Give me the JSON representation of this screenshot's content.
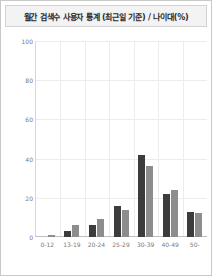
{
  "widget": {
    "title": "월간 검색수 사용자 통계 (최근일 기준) / 나이대(%)"
  },
  "chart_data": {
    "type": "bar",
    "title": "월간 검색수 사용자 통계 (최근일 기준) / 나이대(%)",
    "xlabel": "",
    "ylabel": "",
    "ylim": [
      0,
      100
    ],
    "yticks": [
      100,
      80,
      60,
      40,
      20,
      0
    ],
    "grid": true,
    "legend": "none",
    "categories": [
      "0-12",
      "13-19",
      "20-24",
      "25-29",
      "30-39",
      "40-49",
      "50-"
    ],
    "series": [
      {
        "name": "series-1",
        "color": "#3c3c3c",
        "values": [
          0,
          3,
          6,
          16,
          42,
          22,
          13
        ]
      },
      {
        "name": "series-2",
        "color": "#8d8d8d",
        "values": [
          1,
          6,
          9,
          14,
          36,
          24,
          12
        ]
      }
    ]
  },
  "colors": {
    "series_dark": "#3c3c3c",
    "series_light": "#8d8d8d",
    "grid": "#ececec",
    "axis": "#c0c0c0",
    "title_bg": "#f3f3f3",
    "border": "#c8c8c8",
    "tick_text": "#7a7a7a"
  }
}
